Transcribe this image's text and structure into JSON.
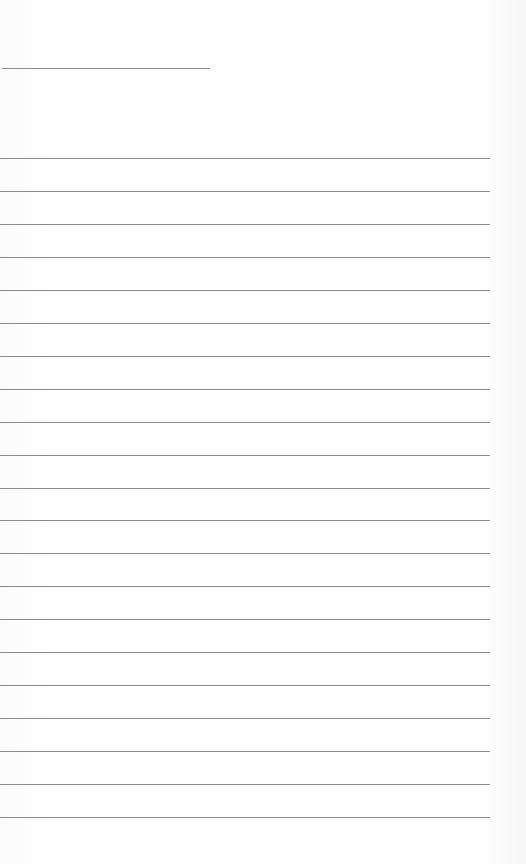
{
  "page": {
    "type": "lined-paper",
    "title": "",
    "line_count": 21,
    "line_color": "#8a8a8a",
    "background_color": "#fdfdfd"
  }
}
